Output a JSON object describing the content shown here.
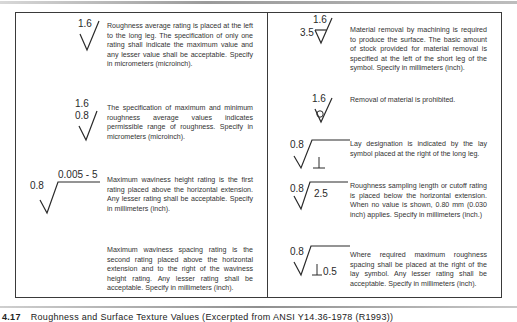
{
  "figure": {
    "caption_number": "4.17",
    "caption_text": "Roughness and Surface Texture Values (Excerpted from ANSI Y14.36-1978 (R1993))"
  },
  "left_column": {
    "items": [
      {
        "symbol": {
          "top": "1.6"
        },
        "text": "Roughness average rating is placed at the left to the long leg. The specification of only one rating shall indicate the maximum value and any lesser value shall be acceptable. Specify in micrometers (microinch)."
      },
      {
        "symbol": {
          "top": "1.6",
          "bottom": "0.8"
        },
        "text": "The specification of maximum and minimum roughness average values indicates permissible range of roughness. Specify in micrometers (microinch)."
      },
      {
        "symbol": {
          "left": "0.8",
          "above_extension": "0.005 - 5"
        },
        "text": "Maximum waviness height rating is the first rating placed above the horizontal extension. Any lesser rating shall be acceptable. Specify in millimeters (inch)."
      },
      {
        "symbol": {},
        "text": "Maximum waviness spacing rating is the second rating placed above the horizontal extension and to the right of the waviness height rating. Any lesser rating shall be acceptable. Specify in millimeters (inch)."
      }
    ]
  },
  "right_column": {
    "items": [
      {
        "symbol": {
          "top": "1.6",
          "left": "3.5"
        },
        "text": "Material removal by machining is required to produce the surface. The basic amount of stock provided for material removal is specified at the left of the short leg of the symbol. Specify in millimeters (inch)."
      },
      {
        "symbol": {
          "top": "1.6"
        },
        "text": "Removal of material is prohibited."
      },
      {
        "symbol": {
          "left": "0.8",
          "lay": "⊥"
        },
        "text": "Lay designation is indicated by the lay symbol placed at the right of the long leg."
      },
      {
        "symbol": {
          "left": "0.8",
          "below_extension": "2.5"
        },
        "text": "Roughness sampling length or cutoff rating is placed below the horizontal extension. When no value is shown, 0.80 mm (0.030 inch) applies. Specify in millimeters (inch.)"
      },
      {
        "symbol": {
          "left": "0.8",
          "lay": "⊥",
          "spacing": "0.5"
        },
        "text": "Where required maximum roughness spacing shall be placed at the right of the lay symbol. Any lesser rating shall be acceptable. Specify in millimeters (inch)."
      }
    ]
  }
}
